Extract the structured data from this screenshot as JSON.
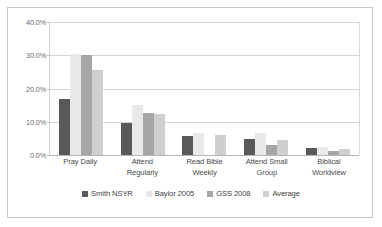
{
  "chart_data": {
    "type": "bar",
    "title": "",
    "subtitle": "",
    "xlabel": "",
    "ylabel": "",
    "categories": [
      "Pray Daily",
      "Attend Regularly",
      "Read Bible Weekly",
      "Attend Small Group",
      "Biblical Worldview"
    ],
    "category_lines": [
      [
        "Pray Daily"
      ],
      [
        "Attend",
        "Regularly"
      ],
      [
        "Read Bible",
        "Weekly"
      ],
      [
        "Attend Small",
        "Group"
      ],
      [
        "Biblical",
        "Worldview"
      ]
    ],
    "series": [
      {
        "name": "Smith NSYR",
        "color": "#595959",
        "values": [
          16.8,
          9.7,
          5.8,
          4.8,
          2.0
        ]
      },
      {
        "name": "Baylor 2005",
        "color": "#e9e9e9",
        "values": [
          30.5,
          15.0,
          6.5,
          6.5,
          2.5
        ]
      },
      {
        "name": "GSS 2008",
        "color": "#a6a6a6",
        "values": [
          30.2,
          12.6,
          0.0,
          3.0,
          1.1
        ]
      },
      {
        "name": "Average",
        "color": "#cfcfcf",
        "values": [
          25.6,
          12.3,
          5.9,
          4.5,
          1.7
        ]
      }
    ],
    "ylim": [
      0,
      40
    ],
    "yticks": [
      0,
      10,
      20,
      30,
      40
    ],
    "ytick_labels": [
      "0.0%",
      "10.0%",
      "20.0%",
      "30.0%",
      "40.0%"
    ],
    "grid": true,
    "legend_position": "bottom"
  }
}
